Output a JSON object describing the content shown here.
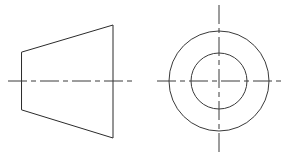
{
  "sheet": {
    "title": "Two-view orthographic engineering drawing",
    "width": 297,
    "height": 158,
    "background_color": "#ffffff",
    "line_color": "#2b2b2b",
    "centerline_color": "#3a3a3a"
  },
  "views": {
    "front_view": {
      "name": "Front view - truncated cone profile",
      "shape": "trapezoid",
      "points": "22,52 113,25 113,138 22,110",
      "left_edge_top": [
        22,
        52
      ],
      "left_edge_bottom": [
        22,
        110
      ],
      "right_edge_top": [
        113,
        25
      ],
      "right_edge_bottom": [
        113,
        138
      ],
      "left_height": 58,
      "right_height": 113,
      "axial_length": 91,
      "centerline": {
        "name": "horizontal-axis",
        "x1": 8,
        "y1": 81,
        "x2": 136,
        "y2": 81,
        "dash_pattern": "19 4 5 4"
      }
    },
    "side_view": {
      "name": "Side view - concentric circles",
      "center_x": 219,
      "center_y": 81,
      "outer_circle": {
        "name": "outer-diameter-circle",
        "radius": 50
      },
      "inner_circle": {
        "name": "inner-bore-circle",
        "radius": 28
      },
      "horizontal_centerline": {
        "name": "horizontal-axis",
        "x1": 157,
        "y1": 81,
        "x2": 284,
        "y2": 81,
        "dash_pattern": "19 4 5 4"
      },
      "vertical_centerline": {
        "name": "vertical-axis",
        "x1": 219,
        "y1": 5,
        "x2": 219,
        "y2": 152,
        "dash_pattern": "19 4 5 4"
      }
    }
  }
}
